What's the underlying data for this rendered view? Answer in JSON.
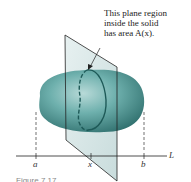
{
  "annotation": {
    "line1": "This plane region",
    "line2": "inside the solid",
    "line3": "has area A(x)."
  },
  "axis": {
    "label": "L",
    "ticks": [
      {
        "label": "a"
      },
      {
        "label": "x"
      },
      {
        "label": "b"
      }
    ]
  },
  "figure_caption": "Figure 7.17",
  "colors": {
    "solid": "#5fa3a0",
    "solid_dark": "#2f6f6d",
    "plane": "#c9dcdc",
    "outline": "#1e5a58",
    "line": "#222222"
  }
}
